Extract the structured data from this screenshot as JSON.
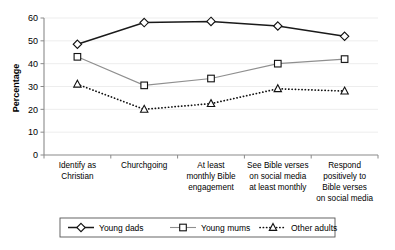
{
  "chart_data": {
    "type": "line",
    "title": "",
    "xlabel": "",
    "ylabel": "Percentage",
    "ylim": [
      0,
      60
    ],
    "yticks": [
      0,
      10,
      20,
      30,
      40,
      50,
      60
    ],
    "grid": true,
    "legend_position": "bottom",
    "categories": [
      "Identify as Christian",
      "Churchgoing",
      "At least monthly Bible engagement",
      "See Bible verses on social media at least monthly",
      "Respond positively to Bible verses on social media"
    ],
    "category_lines": [
      [
        "Identify as",
        "Christian"
      ],
      [
        "Churchgoing"
      ],
      [
        "At least",
        "monthly Bible",
        "engagement"
      ],
      [
        "See Bible verses",
        "on social media",
        "at least monthly"
      ],
      [
        "Respond",
        "positively to",
        "Bible verses",
        "on social media"
      ]
    ],
    "series": [
      {
        "name": "Young dads",
        "marker": "diamond",
        "line_style": "solid",
        "color": "#1a1a1a",
        "values": [
          48.5,
          58.0,
          58.5,
          56.5,
          52.0
        ]
      },
      {
        "name": "Young mums",
        "marker": "square",
        "line_style": "solid",
        "color": "#8f8f8f",
        "values": [
          43.0,
          30.5,
          33.5,
          40.0,
          42.0
        ]
      },
      {
        "name": "Other adults",
        "marker": "triangle",
        "line_style": "dotted",
        "color": "#111111",
        "values": [
          31.0,
          20.0,
          22.5,
          29.0,
          28.0
        ]
      }
    ]
  },
  "legend": {
    "items": [
      {
        "label": "Young dads"
      },
      {
        "label": "Young mums"
      },
      {
        "label": "Other adults"
      }
    ]
  }
}
